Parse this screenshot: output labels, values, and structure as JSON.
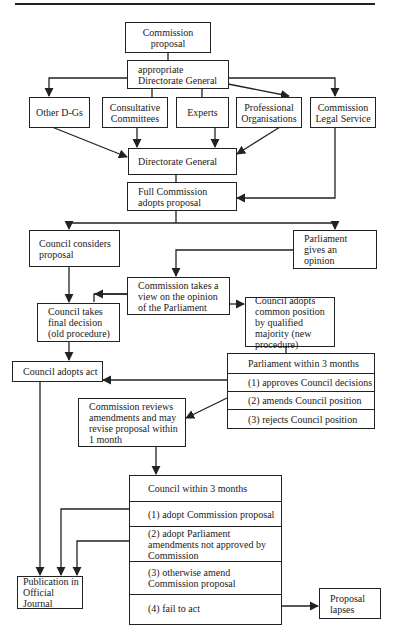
{
  "diagram": {
    "nodes": {
      "commission_proposal": "Commission proposal",
      "appropriate_dg": "appropriate Directorate General",
      "other_dgs": "Other D-Gs",
      "consultative_committees": "Consultative Committees",
      "experts": "Experts",
      "professional_organisations": "Professional Organisations",
      "legal_service": "Commission Legal Service",
      "directorate_general": "Directorate General",
      "full_commission": "Full Commission adopts proposal",
      "council_considers": "Council considers proposal",
      "parliament_opinion": "Parliament gives an opinion",
      "commission_view": "Commission takes a view on the opinion of the Parliament",
      "council_final": "Council takes final decision (old procedure)",
      "council_common": "Council adopts common position by qualified majority (new procedure)",
      "council_adopts_act": "Council adopts act",
      "commission_reviews": "Commission reviews amendments and may revise proposal within 1 month",
      "publication": "Publication in Official Journal",
      "proposal_lapses": "Proposal lapses"
    },
    "parliament_table": {
      "title": "Parliament within 3 months",
      "rows": [
        "(1) approves Council decisions",
        "(2) amends Council position",
        "(3) rejects Council position"
      ]
    },
    "council_table": {
      "title": "Council within 3 months",
      "rows": [
        "(1) adopt Commission proposal",
        "(2) adopt Parliament amendments not approved by Commission",
        "(3) otherwise amend Commission proposal",
        "(4) fail to act"
      ]
    }
  }
}
